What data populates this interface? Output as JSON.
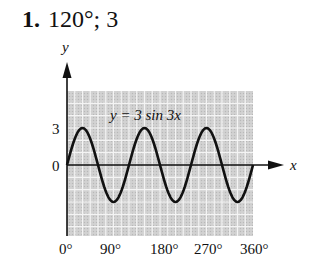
{
  "heading": {
    "number": "1.",
    "answer": "120°; 3"
  },
  "chart_data": {
    "type": "line",
    "title": "",
    "equation_label": "y = 3 sin 3x",
    "xlabel": "x",
    "ylabel": "y",
    "x_ticks": [
      "0°",
      "90°",
      "180°",
      "270°",
      "360°"
    ],
    "y_ticks": [
      "0",
      "3"
    ],
    "xlim": [
      0,
      360
    ],
    "ylim": [
      -3,
      3
    ],
    "grid": true,
    "series": [
      {
        "name": "y = 3 sin 3x",
        "x": [
          0,
          30,
          60,
          90,
          120,
          150,
          180,
          210,
          240,
          270,
          300,
          330,
          360
        ],
        "values": [
          0,
          3,
          0,
          -3,
          0,
          3,
          0,
          -3,
          0,
          3,
          0,
          -3,
          0
        ]
      }
    ],
    "period_deg": 120,
    "amplitude": 3
  }
}
